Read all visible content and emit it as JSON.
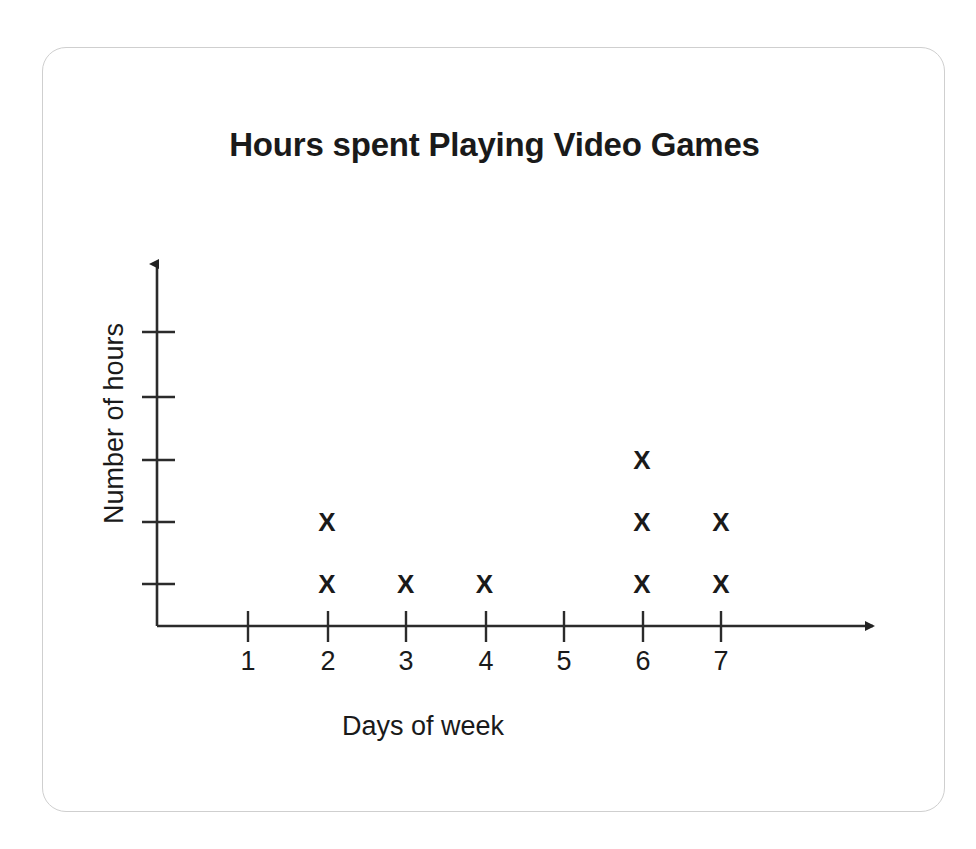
{
  "chart_data": {
    "type": "scatter",
    "plot_style": "dot-plot",
    "title": "Hours spent Playing Video Games",
    "xlabel": "Days of week",
    "ylabel": "Number of hours",
    "categories": [
      1,
      2,
      3,
      4,
      5,
      6,
      7
    ],
    "xtick_labels": [
      "1",
      "2",
      "3",
      "4",
      "5",
      "6",
      "7"
    ],
    "ytick_labels": [
      "",
      "",
      "",
      "",
      ""
    ],
    "values": [
      0,
      2,
      1,
      1,
      0,
      3,
      2
    ],
    "marker": "X",
    "series": [
      {
        "name": "Hours",
        "values": [
          0,
          2,
          1,
          1,
          0,
          3,
          2
        ]
      }
    ],
    "points": [
      {
        "x": 2,
        "y": 1
      },
      {
        "x": 2,
        "y": 2
      },
      {
        "x": 3,
        "y": 1
      },
      {
        "x": 4,
        "y": 1
      },
      {
        "x": 6,
        "y": 1
      },
      {
        "x": 6,
        "y": 2
      },
      {
        "x": 6,
        "y": 3
      },
      {
        "x": 7,
        "y": 1
      },
      {
        "x": 7,
        "y": 2
      }
    ],
    "xlim": [
      0,
      7.5
    ],
    "ylim": [
      0,
      5
    ],
    "y_tick_count": 5,
    "grid": false,
    "legend": false,
    "axis_arrows": true,
    "colors": {
      "ink": "#1a1a1a",
      "axis": "#333333",
      "card_border": "#cfcfcf",
      "background": "#ffffff"
    }
  }
}
